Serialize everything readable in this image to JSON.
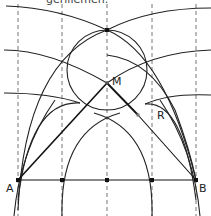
{
  "caption": "gerillemen.",
  "labels": {
    "A": "A",
    "B": "B",
    "M": "M",
    "R": "R"
  },
  "colors": {
    "stroke": "#222222",
    "dashed": "#666666",
    "point": "#111111"
  },
  "points": {
    "A": [
      18,
      180
    ],
    "B": [
      196,
      180
    ],
    "M": [
      107,
      83
    ],
    "R": [
      138,
      115
    ]
  }
}
